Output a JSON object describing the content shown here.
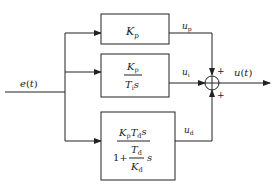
{
  "diagram": {
    "type": "block-diagram",
    "input": {
      "label_main": "e",
      "label_arg": "t"
    },
    "output": {
      "label_main": "u",
      "label_arg": "t"
    },
    "blocks": [
      {
        "id": "proportional",
        "expr": {
          "main": "K",
          "sub": "p"
        },
        "output_signal": {
          "main": "u",
          "sub": "p"
        }
      },
      {
        "id": "integral",
        "numerator": {
          "main": "K",
          "sub": "p"
        },
        "denominator": {
          "main": "T",
          "sub": "i",
          "suffix": "s"
        },
        "output_signal": {
          "main": "u",
          "sub": "i"
        }
      },
      {
        "id": "derivative",
        "numerator": {
          "k": "K",
          "k_sub": "p",
          "t": "T",
          "t_sub": "d",
          "suffix": "s"
        },
        "denominator": {
          "one_plus": "1+",
          "inner_num": {
            "main": "T",
            "sub": "d"
          },
          "inner_den": {
            "main": "K",
            "sub": "d"
          },
          "suffix": "s"
        },
        "output_signal": {
          "main": "u",
          "sub": "d"
        }
      }
    ],
    "summing_junction": {
      "signs": {
        "top": "+",
        "left": "+",
        "bottom": "+"
      }
    }
  }
}
